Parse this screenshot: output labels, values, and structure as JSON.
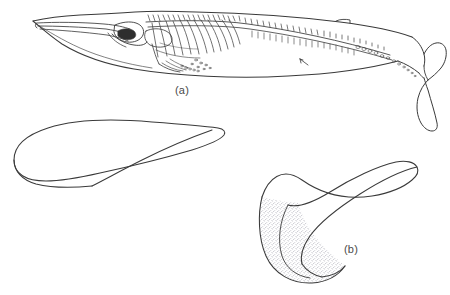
{
  "figure": {
    "kind": "scientific-line-illustration",
    "background_color": "#ffffff",
    "ink_color": "#3a3a3a",
    "stipple_color": "#8a8a96",
    "panels": [
      {
        "id": "a",
        "label": "(a)",
        "caption_text": "(a)",
        "content": "whole whale in lateral view: body outline with skeleton drawn inside, elongated rostrum, ribcage, vertebral column, caudal flukes, small arrow marker on ventral flank"
      },
      {
        "id": "b",
        "label": "(b)",
        "caption_text": "(b)",
        "content": "falcate dorsal fin, enlarged, with stippled shading at the base"
      }
    ],
    "shapes": [
      {
        "name": "whale-body-outline",
        "description": "long streamlined body outline, head at left, tail flukes at right"
      },
      {
        "name": "whale-skeleton",
        "description": "skull, mandible, ribs, neural spines, chevrons, flipper bones"
      },
      {
        "name": "pectoral-flipper-outline",
        "description": "elongated flipper, rounded tip at left, tapering trailing point at upper right"
      },
      {
        "name": "dorsal-fin-outline",
        "description": "sickle-shaped falcate fin curving up and to the right with stippled concave base"
      }
    ]
  }
}
